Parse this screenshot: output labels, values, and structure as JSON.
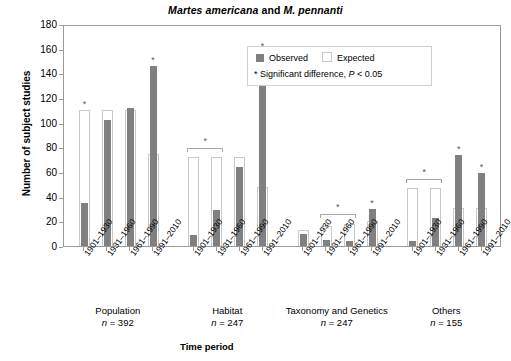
{
  "chart_data": {
    "type": "bar",
    "title": "Martes americana and M. pennanti",
    "title_parts": {
      "species1": "Martes americana",
      "conj": " and ",
      "species2": "M. pennanti"
    },
    "xlabel": "Time period",
    "ylabel": "Number of subject studies",
    "ylim": [
      0,
      180
    ],
    "yticks": [
      0,
      20,
      40,
      60,
      80,
      100,
      120,
      140,
      160,
      180
    ],
    "grid": false,
    "legend_position": "top-center-right",
    "categories": [
      "1901–1930",
      "1931–1960",
      "1961–1990",
      "1991–2010"
    ],
    "series": [
      {
        "name": "Observed",
        "color": "#808080"
      },
      {
        "name": "Expected",
        "color": "#ffffff"
      }
    ],
    "groups": [
      {
        "name": "Population",
        "n_label": "n = 392",
        "n": 392,
        "observed": [
          35,
          102,
          112,
          146
        ],
        "expected": [
          110,
          110,
          110,
          75
        ],
        "significant": [
          true,
          false,
          false,
          true
        ],
        "brackets": []
      },
      {
        "name": "Habitat",
        "n_label": "n = 247",
        "n": 247,
        "observed": [
          9,
          29,
          64,
          157
        ],
        "expected": [
          72,
          72,
          72,
          48
        ],
        "significant": [
          false,
          false,
          false,
          true
        ],
        "brackets": [
          {
            "from": 0,
            "to": 1,
            "top": 76
          }
        ]
      },
      {
        "name": "Taxonomy and Genetics",
        "n_label": "n = 247",
        "n": 247,
        "observed": [
          10,
          5,
          4,
          30
        ],
        "expected": [
          13,
          16,
          18,
          20
        ],
        "significant": [
          false,
          false,
          false,
          true
        ],
        "brackets": [
          {
            "from": 1,
            "to": 2,
            "top": 23
          }
        ]
      },
      {
        "name": "Others",
        "n_label": "n = 155",
        "n": 155,
        "observed": [
          4,
          23,
          74,
          59
        ],
        "expected": [
          47,
          47,
          31,
          31
        ],
        "significant": [
          false,
          false,
          true,
          true
        ],
        "brackets": [
          {
            "from": 0,
            "to": 1,
            "top": 51
          }
        ]
      }
    ]
  },
  "legend": {
    "observed_label": "Observed",
    "expected_label": "Expected",
    "significance_note_prefix": "* Significant difference, ",
    "significance_note_p": "P",
    "significance_note_suffix": " < 0.05",
    "star_glyph": "*"
  },
  "colors": {
    "observed": "#808080",
    "expected_fill": "#ffffff",
    "expected_edge": "#c9c9c9",
    "axis": "#9a9a9a",
    "text": "#000000"
  }
}
